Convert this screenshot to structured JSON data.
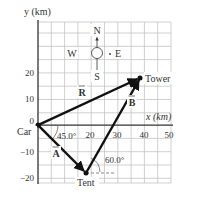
{
  "axes": {
    "y_label": "y (km)",
    "x_label": "x (km)",
    "y_ticks": [
      "20",
      "10",
      "0",
      "−10",
      "−20"
    ],
    "x_ticks": [
      "20",
      "30",
      "40",
      "50"
    ]
  },
  "compass": {
    "north": "N",
    "south": "S",
    "east": "E",
    "west": "W"
  },
  "points": {
    "car": "Car",
    "tent": "Tent",
    "tower": "Tower"
  },
  "vectors": {
    "A": "A",
    "B": "B",
    "R": "R"
  },
  "angles": {
    "car_angle": "45.0°",
    "tent_angle": "60.0°"
  },
  "colors": {
    "grid": "#b8b8b8",
    "axis": "#333333",
    "vector": "#111111"
  }
}
